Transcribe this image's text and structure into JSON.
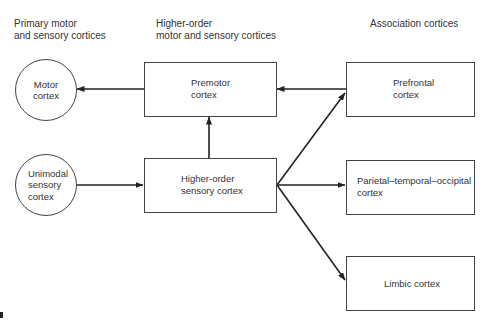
{
  "headers": {
    "primary": [
      "Primary motor",
      "and sensory cortices"
    ],
    "higher_order": [
      "Higher-order",
      "motor and sensory cortices"
    ],
    "association": [
      "Association cortices"
    ]
  },
  "nodes": {
    "motor": {
      "shape": "circle",
      "lines": [
        "Motor",
        "cortex"
      ]
    },
    "unimodal": {
      "shape": "circle",
      "lines": [
        "Unimodal",
        "sensory",
        "cortex"
      ]
    },
    "premotor": {
      "shape": "box",
      "lines": [
        "Premotor",
        "cortex"
      ]
    },
    "higher_sensory": {
      "shape": "box",
      "lines": [
        "Higher-order",
        "sensory cortex"
      ]
    },
    "prefrontal": {
      "shape": "box",
      "lines": [
        "Prefrontal",
        "cortex"
      ]
    },
    "parietal": {
      "shape": "box",
      "lines": [
        "Parietal–temporal–occipital",
        "cortex"
      ]
    },
    "limbic": {
      "shape": "box",
      "lines": [
        "Limbic cortex"
      ]
    }
  },
  "edges": [
    {
      "from": "premotor",
      "to": "motor"
    },
    {
      "from": "unimodal",
      "to": "higher_sensory"
    },
    {
      "from": "higher_sensory",
      "to": "premotor"
    },
    {
      "from": "prefrontal",
      "to": "premotor"
    },
    {
      "from": "higher_sensory",
      "to": "prefrontal"
    },
    {
      "from": "higher_sensory",
      "to": "parietal"
    },
    {
      "from": "higher_sensory",
      "to": "limbic"
    }
  ],
  "colors": {
    "line": "#222222",
    "text": "#333333",
    "background": "#ffffff"
  }
}
